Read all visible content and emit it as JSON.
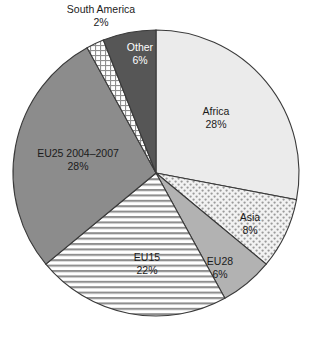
{
  "chart_data": {
    "type": "pie",
    "title": "",
    "subtitle": "",
    "xlabel": "",
    "ylabel": "",
    "legend_position": "none",
    "grid": false,
    "labels_on_slices": true,
    "start_angle_deg": 0,
    "direction": "clockwise",
    "categories": [
      "Africa",
      "Asia",
      "EU28",
      "EU15",
      "EU25 2004–2007",
      "South America",
      "Other"
    ],
    "values": [
      28,
      8,
      6,
      22,
      28,
      2,
      6
    ],
    "value_labels": [
      "28%",
      "8%",
      "6%",
      "22%",
      "28%",
      "2%",
      "6%"
    ],
    "units": "percent",
    "total": 100,
    "slices": [
      {
        "name": "Africa",
        "label": "Africa",
        "value": 28,
        "value_label": "28%",
        "fill_style": "solid-very-light",
        "fill_color": "#ebebeb",
        "label_color": "#1b1b1b",
        "label_placement": "inside",
        "label_x": 216,
        "label_y": 115
      },
      {
        "name": "Asia",
        "label": "Asia",
        "value": 8,
        "value_label": "8%",
        "fill_style": "dotted",
        "fill_color": "#f0f0f0",
        "pattern_color": "#9a9a9a",
        "label_color": "#1b1b1b",
        "label_placement": "inside",
        "label_x": 250,
        "label_y": 221
      },
      {
        "name": "EU28",
        "label": "EU28",
        "value": 6,
        "value_label": "6%",
        "fill_style": "solid-medium-light",
        "fill_color": "#b2b2b2",
        "label_color": "#1b1b1b",
        "label_placement": "inside",
        "label_x": 220,
        "label_y": 265
      },
      {
        "name": "EU15",
        "label": "EU15",
        "value": 22,
        "value_label": "22%",
        "fill_style": "horizontal-stripes",
        "fill_color": "#ffffff",
        "pattern_color": "#8f8f8f",
        "label_color": "#1b1b1b",
        "label_placement": "inside",
        "label_x": 147,
        "label_y": 261
      },
      {
        "name": "EU25 2004–2007",
        "label": "EU25 2004–2007",
        "value": 28,
        "value_label": "28%",
        "fill_style": "solid-medium",
        "fill_color": "#8c8c8c",
        "label_color": "#1b1b1b",
        "label_placement": "inside",
        "label_x": 78,
        "label_y": 157
      },
      {
        "name": "South America",
        "label": "South America",
        "value": 2,
        "value_label": "2%",
        "fill_style": "cross-hatch-grid",
        "fill_color": "#ffffff",
        "pattern_color": "#8f8f8f",
        "label_color": "#1b1b1b",
        "label_placement": "outside",
        "label_x": 101,
        "label_y": 13
      },
      {
        "name": "Other",
        "label": "Other",
        "value": 6,
        "value_label": "6%",
        "fill_style": "solid-dark",
        "fill_color": "#565656",
        "label_color": "#ffffff",
        "label_placement": "inside",
        "label_x": 140,
        "label_y": 51
      }
    ],
    "geometry": {
      "center_x": 156,
      "center_y": 173,
      "radius": 143
    },
    "style": {
      "outline_color": "#3a3a3a",
      "background": "#ffffff"
    }
  }
}
